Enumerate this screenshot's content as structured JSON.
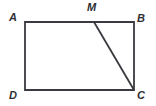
{
  "figure": {
    "kind": "geometry-diagram",
    "canvas": {
      "width": 156,
      "height": 106
    },
    "colors": {
      "background": "#ffffff",
      "stroke": "#3a3a40",
      "label": "#2e2e33",
      "fill": "none"
    },
    "stroke_width": 1.8,
    "labels": {
      "a": "A",
      "b": "B",
      "m": "M",
      "c": "C",
      "d": "D"
    },
    "points": {
      "A": {
        "x": 25,
        "y": 22
      },
      "B": {
        "x": 134,
        "y": 22
      },
      "C": {
        "x": 134,
        "y": 90
      },
      "D": {
        "x": 25,
        "y": 90
      },
      "M": {
        "x": 94,
        "y": 22
      }
    },
    "segments": [
      {
        "name": "AB",
        "from": "A",
        "to": "B"
      },
      {
        "name": "BC",
        "from": "B",
        "to": "C"
      },
      {
        "name": "CD",
        "from": "C",
        "to": "D"
      },
      {
        "name": "DA",
        "from": "D",
        "to": "A"
      },
      {
        "name": "MC",
        "from": "M",
        "to": "C"
      }
    ]
  }
}
